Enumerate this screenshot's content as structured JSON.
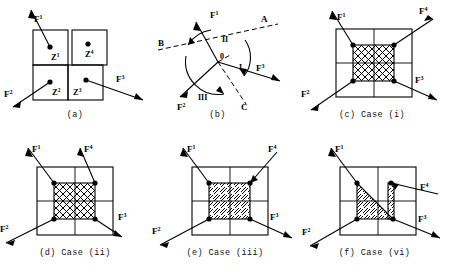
{
  "figure": {
    "panels": [
      {
        "id": "a",
        "caption": "(a)",
        "zones": [
          {
            "label": "Z",
            "sup": "1"
          },
          {
            "label": "Z",
            "sup": "4"
          },
          {
            "label": "Z",
            "sup": "2"
          },
          {
            "label": "Z",
            "sup": "3"
          }
        ],
        "forces": [
          {
            "label": "F",
            "sup": "1"
          },
          {
            "label": "F",
            "sup": "2"
          },
          {
            "label": "F",
            "sup": "3"
          }
        ]
      },
      {
        "id": "b",
        "caption": "(b)",
        "origin": "0",
        "regions": [
          "I",
          "II",
          "III"
        ],
        "lines": [
          "A",
          "B",
          "C"
        ],
        "forces": [
          {
            "label": "F",
            "sup": "1"
          },
          {
            "label": "F",
            "sup": "2"
          },
          {
            "label": "F",
            "sup": "3"
          }
        ]
      },
      {
        "id": "c",
        "caption": "(c) Case (i)",
        "fill": "crosshatch",
        "forces": [
          {
            "label": "F",
            "sup": "1"
          },
          {
            "label": "F",
            "sup": "2"
          },
          {
            "label": "F",
            "sup": "3"
          },
          {
            "label": "F",
            "sup": "4"
          }
        ]
      },
      {
        "id": "d",
        "caption": "(d) Case (ii)",
        "fill": "crosshatch",
        "forces": [
          {
            "label": "F",
            "sup": "1"
          },
          {
            "label": "F",
            "sup": "2"
          },
          {
            "label": "F",
            "sup": "3"
          },
          {
            "label": "F",
            "sup": "4"
          }
        ]
      },
      {
        "id": "e",
        "caption": "(e) Case (iii)",
        "fill": "diagonal-hatch",
        "forces": [
          {
            "label": "F",
            "sup": "1"
          },
          {
            "label": "F",
            "sup": "2"
          },
          {
            "label": "F",
            "sup": "3"
          },
          {
            "label": "F",
            "sup": "4"
          }
        ]
      },
      {
        "id": "f",
        "caption": "(f) Case (vi)",
        "fill": "diagonal-hatch-triangle",
        "forces": [
          {
            "label": "F",
            "sup": "1"
          },
          {
            "label": "F",
            "sup": "2"
          },
          {
            "label": "F",
            "sup": "3"
          },
          {
            "label": "F",
            "sup": "4"
          }
        ]
      }
    ],
    "colors": {
      "ink": "#000000",
      "background": "#ffffff"
    }
  }
}
